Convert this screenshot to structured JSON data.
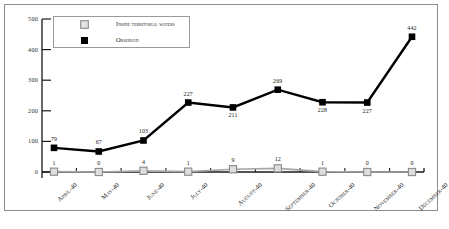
{
  "chart_data": {
    "type": "line",
    "title": "",
    "subtitle": "",
    "xlabel": "",
    "ylabel": "",
    "ylim": [
      0,
      500
    ],
    "yticks": [
      0,
      100,
      200,
      300,
      400,
      500
    ],
    "ytick_labels": [
      "0",
      "100",
      "200",
      "300",
      "400",
      "500"
    ],
    "grid": false,
    "legend_position": "top-left",
    "categories": [
      "April-40",
      "May-40",
      "June-40",
      "July-40",
      "August-40",
      "September-40",
      "October-40",
      "November-40",
      "December-40"
    ],
    "series": [
      {
        "name": "Inside territorial waters",
        "color": "#a6a6a6",
        "marker": "open-square",
        "values": [
          1,
          0,
          4,
          1,
          9,
          12,
          1,
          0,
          0
        ],
        "value_labels": [
          "1",
          "0",
          "4",
          "1",
          "9",
          "12",
          "1",
          "0",
          "0"
        ]
      },
      {
        "name": "Observed",
        "color": "#000000",
        "marker": "filled-square",
        "values": [
          79,
          67,
          103,
          227,
          211,
          269,
          228,
          227,
          442
        ],
        "value_labels": [
          "79",
          "67",
          "103",
          "227",
          "211",
          "269",
          "228",
          "227",
          "442"
        ]
      }
    ]
  },
  "legend": {
    "items": [
      {
        "label": "Inside territorial waters"
      },
      {
        "label": "Observed"
      }
    ]
  },
  "colors": {
    "observed": "#000000",
    "inside_territorial_waters": "#a6a6a6",
    "axis": "#1a1a1a",
    "frame": "#8d8d8d",
    "background": "#ffffff"
  }
}
